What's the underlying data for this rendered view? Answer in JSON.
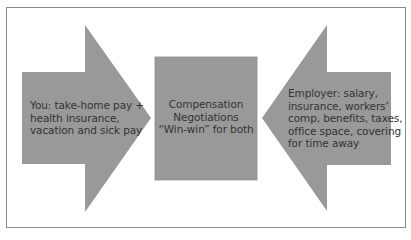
{
  "diagram": {
    "colors": {
      "shape_fill": "#999999",
      "text": "#333333",
      "frame_border": "#8a8a8a",
      "background": "#ffffff"
    },
    "left_arrow": {
      "direction": "right",
      "lines": [
        "You: take-home pay +",
        "health insurance,",
        "vacation and sick pay"
      ]
    },
    "center_box": {
      "lines": [
        "Compensation",
        "Negotiations",
        "“Win-win” for both"
      ]
    },
    "right_arrow": {
      "direction": "left",
      "lines": [
        "Employer: salary,",
        "insurance, workers’",
        "comp, benefits, taxes,",
        "office space, covering",
        "for time away"
      ]
    }
  }
}
